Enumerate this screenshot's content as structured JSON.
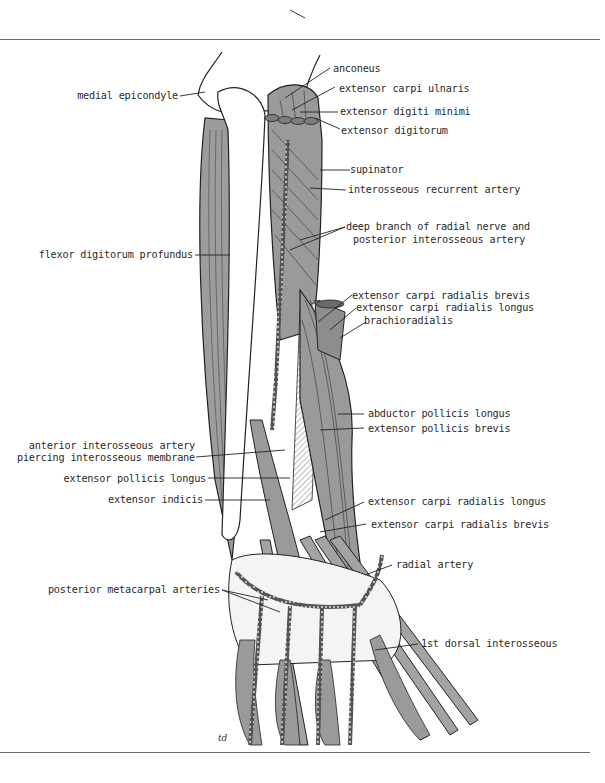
{
  "figure": {
    "colors": {
      "muscle": "#9a9a9a",
      "muscle_dark": "#7d7d7d",
      "bone": "#ffffff",
      "line": "#1e1e1e",
      "rule": "#6b6b6b"
    },
    "artist_initials": "td"
  },
  "labels": {
    "anconeus": "anconeus",
    "extensor_carpi_ulnaris": "extensor carpi ulnaris",
    "medial_epicondyle": "medial epicondyle",
    "extensor_digiti_minimi": "extensor digiti minimi",
    "extensor_digitorum": "extensor digitorum",
    "supinator": "supinator",
    "interosseous_recurrent_artery": "interosseous recurrent artery",
    "deep_branch_line1": "deep branch of radial nerve and",
    "deep_branch_line2": "posterior interosseous artery",
    "flexor_digitorum_profundus": "flexor digitorum profundus",
    "ecrb_upper": "extensor carpi radialis brevis",
    "ecrl_upper": "extensor carpi radialis longus",
    "brachioradialis": "brachioradialis",
    "abductor_pollicis_longus": "abductor pollicis longus",
    "extensor_pollicis_brevis": "extensor pollicis brevis",
    "anterior_interosseous_line1": "anterior interosseous artery",
    "anterior_interosseous_line2": "piercing interosseous membrane",
    "extensor_pollicis_longus": "extensor pollicis longus",
    "extensor_indicis": "extensor indicis",
    "ecrl_lower": "extensor carpi radialis longus",
    "ecrb_lower": "extensor carpi radialis brevis",
    "radial_artery": "radial artery",
    "posterior_metacarpal_arteries": "posterior metacarpal arteries",
    "first_dorsal_interosseous": "1st dorsal interosseous"
  }
}
